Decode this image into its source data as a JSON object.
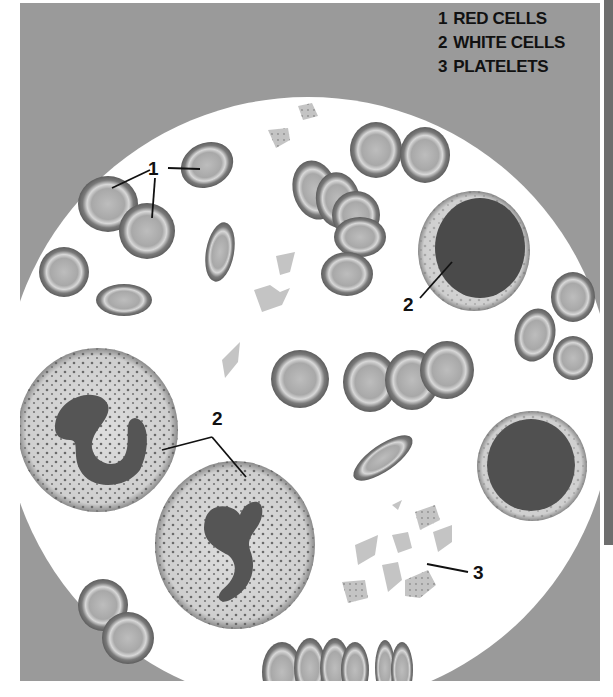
{
  "legend": {
    "items": [
      {
        "number": "1",
        "label": "RED CELLS"
      },
      {
        "number": "2",
        "label": "WHITE CELLS"
      },
      {
        "number": "3",
        "label": "PLATELETS"
      }
    ]
  },
  "callouts": {
    "red_cells": "1",
    "white_cell_lymphocyte": "2",
    "white_cells_neutrophils": "2",
    "platelets": "3"
  },
  "colors": {
    "background_panel": "#9a9a9a",
    "field": "#ffffff",
    "red_cell_rim": "#6a6a6a",
    "red_cell_center": "#b4b4b4",
    "white_cell_cytoplasm": "#d2d2d2",
    "nucleus_dark": "#4a4a4a",
    "platelet": "#c4c4c4"
  }
}
